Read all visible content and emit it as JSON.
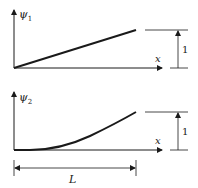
{
  "diagram": {
    "panels": [
      {
        "id": "psi1",
        "ylabel": "ψ",
        "ylabel_sub": "1",
        "xlabel": "x",
        "height_label": "1",
        "shape": "linear ramp from 0 to 1"
      },
      {
        "id": "psi2",
        "ylabel": "ψ",
        "ylabel_sub": "2",
        "xlabel": "x",
        "height_label": "1",
        "shape": "smooth curve starting flat at 0 rising to 1"
      }
    ],
    "length_label": "L",
    "colors": {
      "ink": "#1a1a1a",
      "background": "#ffffff"
    }
  }
}
